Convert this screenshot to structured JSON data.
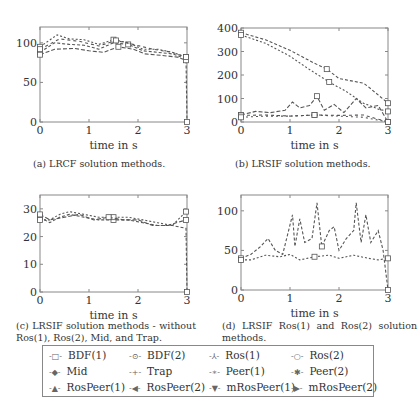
{
  "chart_data": [
    {
      "id": "a",
      "type": "line",
      "title": "",
      "caption": "(a) LRCF solution methods.",
      "xlabel": "time in s",
      "ylabel": "",
      "xlim": [
        0,
        3
      ],
      "ylim": [
        0,
        120
      ],
      "xticks": [
        0,
        1,
        2,
        3
      ],
      "yticks": [
        0,
        50,
        100
      ],
      "grid": false,
      "series": [
        {
          "name": "BDF(1)",
          "x": [
            0,
            0.3,
            0.6,
            0.9,
            1.2,
            1.5,
            1.8,
            2.1,
            2.4,
            2.7,
            2.98,
            3.0
          ],
          "y": [
            88,
            100,
            98,
            97,
            92,
            100,
            98,
            90,
            88,
            86,
            80,
            0
          ]
        },
        {
          "name": "mRosPeer(1)",
          "x": [
            0,
            0.35,
            0.6,
            0.9,
            1.2,
            1.5,
            1.8,
            2.1,
            2.4,
            2.7,
            2.98
          ],
          "y": [
            95,
            110,
            105,
            104,
            98,
            104,
            100,
            92,
            92,
            88,
            82
          ]
        },
        {
          "name": "RosPeer(1)",
          "x": [
            0,
            0.3,
            0.7,
            1.0,
            1.3,
            1.6,
            1.9,
            2.15,
            2.5,
            2.8,
            2.98
          ],
          "y": [
            85,
            92,
            93,
            90,
            88,
            95,
            92,
            86,
            84,
            82,
            78
          ]
        },
        {
          "name": "BDF(2)",
          "x": [
            0,
            0.4,
            0.8,
            1.2,
            1.55,
            1.9,
            2.3,
            2.7,
            2.98
          ],
          "y": [
            92,
            105,
            102,
            96,
            103,
            98,
            92,
            88,
            82
          ]
        }
      ]
    },
    {
      "id": "b",
      "type": "line",
      "title": "",
      "caption": "(b) LRSIF solution methods.",
      "xlabel": "time in s",
      "ylabel": "",
      "xlim": [
        0,
        3
      ],
      "ylim": [
        0,
        400
      ],
      "xticks": [
        0,
        1,
        2,
        3
      ],
      "yticks": [
        0,
        100,
        200,
        300,
        400
      ],
      "grid": false,
      "series": [
        {
          "name": "Trap",
          "x": [
            0,
            0.5,
            1.0,
            1.5,
            1.75,
            2.0,
            2.5,
            2.6,
            3.0
          ],
          "y": [
            380,
            350,
            305,
            250,
            225,
            185,
            165,
            150,
            80
          ]
        },
        {
          "name": "Mid",
          "x": [
            0,
            0.5,
            1.0,
            1.35,
            1.8,
            2.15,
            2.5,
            2.8,
            3.0
          ],
          "y": [
            370,
            335,
            280,
            230,
            170,
            130,
            80,
            55,
            45
          ]
        },
        {
          "name": "Ros(1)",
          "x": [
            0,
            0.3,
            0.6,
            0.9,
            1.05,
            1.2,
            1.4,
            1.55,
            1.7,
            1.9,
            2.1,
            2.35,
            2.55,
            2.8,
            3.0
          ],
          "y": [
            30,
            45,
            40,
            50,
            85,
            60,
            70,
            110,
            50,
            75,
            40,
            100,
            60,
            70,
            0
          ]
        },
        {
          "name": "BDF(1)",
          "x": [
            0,
            0.5,
            1.0,
            1.5,
            2.0,
            2.5,
            3.0
          ],
          "y": [
            28,
            30,
            25,
            30,
            28,
            30,
            0
          ]
        },
        {
          "name": "Ros(2)",
          "x": [
            0,
            0.5,
            1.0,
            1.5,
            2.0,
            2.5,
            3.0
          ],
          "y": [
            20,
            25,
            25,
            30,
            25,
            20,
            0
          ]
        }
      ]
    },
    {
      "id": "c",
      "type": "line",
      "title": "",
      "caption": "(c) LRSIF solution methods - without Ros(1), Ros(2), Mid, and Trap.",
      "xlabel": "time in s",
      "ylabel": "",
      "xlim": [
        0,
        3
      ],
      "ylim": [
        0,
        35
      ],
      "xticks": [
        0,
        1,
        2,
        3
      ],
      "yticks": [
        0,
        10,
        20,
        30
      ],
      "grid": false,
      "series": [
        {
          "name": "BDF(1)",
          "x": [
            0,
            0.2,
            0.4,
            0.6,
            0.9,
            1.2,
            1.5,
            1.8,
            2.1,
            2.4,
            2.7,
            2.98,
            3.0
          ],
          "y": [
            27,
            25,
            27,
            28,
            27,
            26,
            26,
            26,
            25,
            24,
            24,
            23,
            0
          ]
        },
        {
          "name": "Peer(1)",
          "x": [
            0,
            0.2,
            0.4,
            0.6,
            0.9,
            1.2,
            1.5,
            1.8,
            2.1,
            2.4,
            2.7,
            2.98
          ],
          "y": [
            26,
            26,
            28,
            29,
            28,
            27,
            27,
            27,
            26,
            25,
            24,
            29
          ]
        },
        {
          "name": "RosPeer(2)",
          "x": [
            0,
            0.2,
            0.5,
            0.8,
            1.1,
            1.4,
            1.7,
            2.0,
            2.3,
            2.6,
            2.98
          ],
          "y": [
            28,
            26,
            27,
            28,
            26,
            27,
            26,
            26,
            24,
            24,
            26
          ]
        }
      ]
    },
    {
      "id": "d",
      "type": "line",
      "title": "",
      "caption": "(d) LRSIF Ros(1) and Ros(2) solution methods.",
      "xlabel": "time in s",
      "ylabel": "",
      "xlim": [
        0,
        3
      ],
      "ylim": [
        0,
        120
      ],
      "xticks": [
        0,
        1,
        2,
        3
      ],
      "yticks": [
        0,
        50,
        100
      ],
      "grid": false,
      "series": [
        {
          "name": "Ros(1)",
          "x": [
            0,
            0.2,
            0.4,
            0.55,
            0.7,
            0.85,
            1.05,
            1.1,
            1.2,
            1.3,
            1.45,
            1.55,
            1.65,
            1.8,
            1.9,
            2.0,
            2.15,
            2.3,
            2.35,
            2.45,
            2.55,
            2.65,
            2.8,
            2.9,
            3.0
          ],
          "y": [
            40,
            45,
            55,
            65,
            50,
            45,
            95,
            55,
            90,
            60,
            65,
            110,
            55,
            75,
            80,
            50,
            65,
            75,
            110,
            60,
            95,
            60,
            75,
            50,
            0
          ]
        },
        {
          "name": "Ros(2)",
          "x": [
            0,
            0.2,
            0.5,
            0.8,
            1.0,
            1.2,
            1.5,
            1.8,
            2.0,
            2.3,
            2.6,
            2.8,
            3.0
          ],
          "y": [
            38,
            38,
            44,
            42,
            45,
            38,
            42,
            44,
            40,
            44,
            40,
            38,
            40
          ]
        }
      ]
    }
  ],
  "legend": {
    "entries": [
      {
        "label": "BDF(1)",
        "marker": "square"
      },
      {
        "label": "BDF(2)",
        "marker": "circle-dot"
      },
      {
        "label": "Ros(1)",
        "marker": "tri-star"
      },
      {
        "label": "Ros(2)",
        "marker": "circle-open"
      },
      {
        "label": "Mid",
        "marker": "diamond"
      },
      {
        "label": "Trap",
        "marker": "plus"
      },
      {
        "label": "Peer(1)",
        "marker": "asterisk"
      },
      {
        "label": "Peer(2)",
        "marker": "star"
      },
      {
        "label": "RosPeer(1)",
        "marker": "triangle-up"
      },
      {
        "label": "RosPeer(2)",
        "marker": "triangle-left"
      },
      {
        "label": "mRosPeer(1)",
        "marker": "triangle-down"
      },
      {
        "label": "mRosPeer(2)",
        "marker": "triangle-right"
      }
    ]
  },
  "colors": {
    "line": "#555555",
    "axis": "#888888",
    "text": "#333333"
  }
}
